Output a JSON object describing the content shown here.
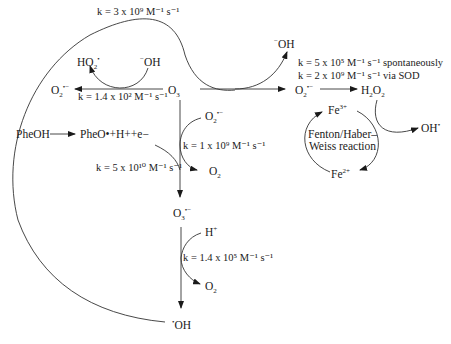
{
  "diagram": {
    "species": {
      "o3": {
        "base": "O",
        "sub": "3",
        "sup": ""
      },
      "o2_superoxide_left": {
        "base": "O",
        "sub": "2",
        "sup": "•−"
      },
      "ho2": {
        "base": "HO",
        "sub": "2",
        "sup": "•"
      },
      "oh_minus_left": {
        "pre": "−",
        "base": "OH"
      },
      "oh_minus_top": {
        "pre": "−",
        "base": "OH"
      },
      "o2_superoxide_right": {
        "base": "O",
        "sub": "2",
        "sup": "•−"
      },
      "h2o2": {
        "text": "H",
        "sub1": "2",
        "mid": "O",
        "sub2": "2"
      },
      "fe3": {
        "base": "Fe",
        "sup": "3+"
      },
      "fe2": {
        "base": "Fe",
        "sup": "2+"
      },
      "oh_radical_right": {
        "base": "OH",
        "sup": "•"
      },
      "pheoh": {
        "text": "PheOH"
      },
      "pheo_products": {
        "text": "PheO•+H++e−"
      },
      "o2_superoxide_mid": {
        "base": "O",
        "sub": "2",
        "sup": "•−"
      },
      "o2_mid": {
        "base": "O",
        "sub": "2"
      },
      "o3_radical": {
        "base": "O",
        "sub": "3",
        "sup": "•−"
      },
      "h_plus": {
        "base": "H",
        "sup": "+"
      },
      "o2_bottom": {
        "base": "O",
        "sub": "2"
      },
      "oh_radical_bottom": {
        "pre": "•",
        "base": "OH"
      }
    },
    "rate_constants": {
      "top_curve": "k = 3 x 10⁹ M⁻¹ s⁻¹",
      "o3_to_o2_left": "k = 1.4 x 10² M⁻¹ s⁻¹",
      "spontaneous": "k = 5 x 10⁵ M⁻¹ s⁻¹ spontaneously",
      "via_sod": "k = 2 x 10⁹ M⁻¹ s⁻¹ via SOD",
      "o2_superoxide_attack": "k = 1 x 10⁹ M⁻¹ s⁻¹",
      "pheo_attack": "k = 5 x 10¹⁰ M⁻¹ s⁻¹",
      "h_plus_attack": "k = 1.4 x 10⁵ M⁻¹ s⁻¹"
    },
    "cycle_label_line1": "Fenton/Haber–",
    "cycle_label_line2": "Weiss reaction"
  }
}
